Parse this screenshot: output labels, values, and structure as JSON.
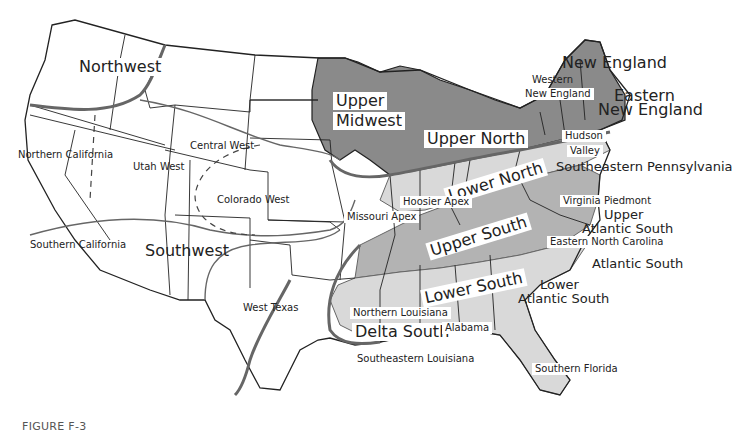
{
  "figure": {
    "caption": "FIGURE F-3"
  },
  "colors": {
    "dark_region": "#8a8a8a",
    "mid_region": "#b3b3b3",
    "light_region": "#d9d9d9",
    "boundary": "#666666",
    "state_line": "#222222",
    "background": "#ffffff"
  },
  "regions": {
    "northwest": "Northwest",
    "upper_midwest_1": "Upper",
    "upper_midwest_2": "Midwest",
    "new_england": "New England",
    "western_new_england_1": "Western",
    "western_new_england_2": "New England",
    "eastern_new_england_1": "Eastern",
    "eastern_new_england_2": "New England",
    "upper_north": "Upper North",
    "hudson_valley_1": "Hudson",
    "hudson_valley_2": "Valley",
    "southeastern_pennsylvania": "Southeastern Pennsylvania",
    "lower_north": "Lower North",
    "hoosier_apex": "Hoosier Apex",
    "missouri_apex": "Missouri Apex",
    "virginia_piedmont": "Virginia Piedmont",
    "upper_atlantic_south_1": "Upper",
    "upper_atlantic_south_2": "Atlantic South",
    "upper_south": "Upper South",
    "eastern_north_carolina": "Eastern North Carolina",
    "atlantic_south": "Atlantic South",
    "lower_south": "Lower South",
    "lower_atlantic_south_1": "Lower",
    "lower_atlantic_south_2": "Atlantic South",
    "northern_louisiana": "Northern Louisiana",
    "delta_south": "Delta South",
    "alabama": "Alabama",
    "southeastern_louisiana": "Southeastern Louisiana",
    "southern_florida": "Southern Florida",
    "northern_california": "Northern California",
    "utah_west": "Utah West",
    "central_west": "Central West",
    "colorado_west": "Colorado West",
    "southern_california": "Southern California",
    "southwest": "Southwest",
    "west_texas": "West Texas"
  }
}
